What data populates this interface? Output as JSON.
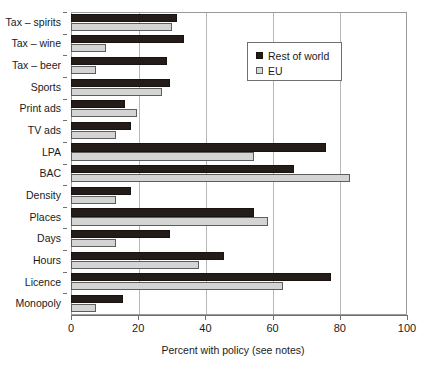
{
  "chart_data": {
    "type": "bar",
    "orientation": "horizontal",
    "title": "",
    "xlabel": "Percent with policy (see notes)",
    "ylabel": "",
    "xlim": [
      0,
      100
    ],
    "xticks": [
      0,
      20,
      40,
      60,
      80,
      100
    ],
    "xtick_labels": [
      "0",
      "20",
      "40",
      "60",
      "80",
      "100"
    ],
    "grid": "vertical",
    "legend_position": "upper-right-inside",
    "categories": [
      "Tax – spirits",
      "Tax – wine",
      "Tax – beer",
      "Sports",
      "Print ads",
      "TV ads",
      "LPA",
      "BAC",
      "Density",
      "Places",
      "Days",
      "Hours",
      "Licence",
      "Monopoly"
    ],
    "series": [
      {
        "name": "Rest of world",
        "color": "#231c19",
        "values": [
          31.5,
          33.5,
          28.5,
          29.5,
          16.0,
          18.0,
          76.0,
          66.5,
          18.0,
          54.5,
          29.5,
          45.5,
          77.5,
          15.5
        ]
      },
      {
        "name": "EU",
        "color": "#d4d4d4",
        "values": [
          30.0,
          10.5,
          7.5,
          27.0,
          19.5,
          13.5,
          54.5,
          83.0,
          13.5,
          58.5,
          13.5,
          38.0,
          63.0,
          7.5
        ]
      }
    ]
  },
  "legend": {
    "items": [
      {
        "label": "Rest of world",
        "key": "rest"
      },
      {
        "label": "EU",
        "key": "eu"
      }
    ]
  }
}
